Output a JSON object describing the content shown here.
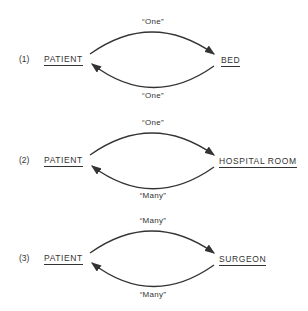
{
  "diagrams": [
    {
      "number": "(1)",
      "left": "PATIENT",
      "right": "BED",
      "top_card": "“One”",
      "bottom_card": "“One”"
    },
    {
      "number": "(2)",
      "left": "PATIENT",
      "right": "HOSPITAL ROOM",
      "top_card": "“One”",
      "bottom_card": "“Many”"
    },
    {
      "number": "(3)",
      "left": "PATIENT",
      "right": "SURGEON",
      "top_card": "“Many”",
      "bottom_card": "“Many”"
    }
  ]
}
